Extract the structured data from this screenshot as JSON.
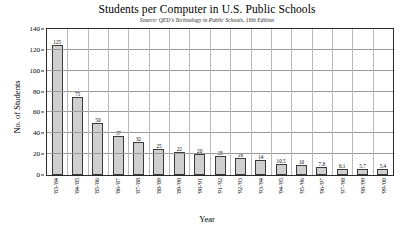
{
  "chart_data": {
    "type": "bar",
    "title": "Students per Computer in U.S. Public Schools",
    "subtitle": "Source: QED's Technology in Public Schools, 16th Edition",
    "xlabel": "Year",
    "ylabel": "No. of Students",
    "ylim": [
      0,
      140
    ],
    "yticks": [
      0,
      20,
      40,
      60,
      80,
      100,
      120,
      140
    ],
    "grid": true,
    "legend": "none",
    "categories": [
      "'83-'84",
      "'84-'85",
      "'85-'86",
      "'86-'87",
      "'87-'88",
      "'88-'89",
      "'89-'90",
      "'90-'91",
      "'91-'92",
      "'92-'93",
      "'93-'94",
      "'94-'95",
      "'95-'96",
      "'96-'97",
      "'97-'98",
      "'98-'99",
      "'99-'00"
    ],
    "values": [
      125,
      75,
      50,
      37,
      32,
      25,
      22,
      20,
      18,
      16,
      14,
      10.5,
      10,
      7.8,
      6.1,
      5.7,
      5.4
    ],
    "value_labels": [
      "125",
      "75",
      "50",
      "37",
      "32",
      "25",
      "22",
      "20",
      "18",
      "16",
      "14",
      "10.5",
      "10",
      "7.8",
      "6.1",
      "5.7",
      "5.4"
    ],
    "bar_color": "#cfcfcf",
    "bar_border_color": "#3a3a3a",
    "grid_color": "#9a9a9a",
    "axis_color": "#2a2a2a"
  }
}
